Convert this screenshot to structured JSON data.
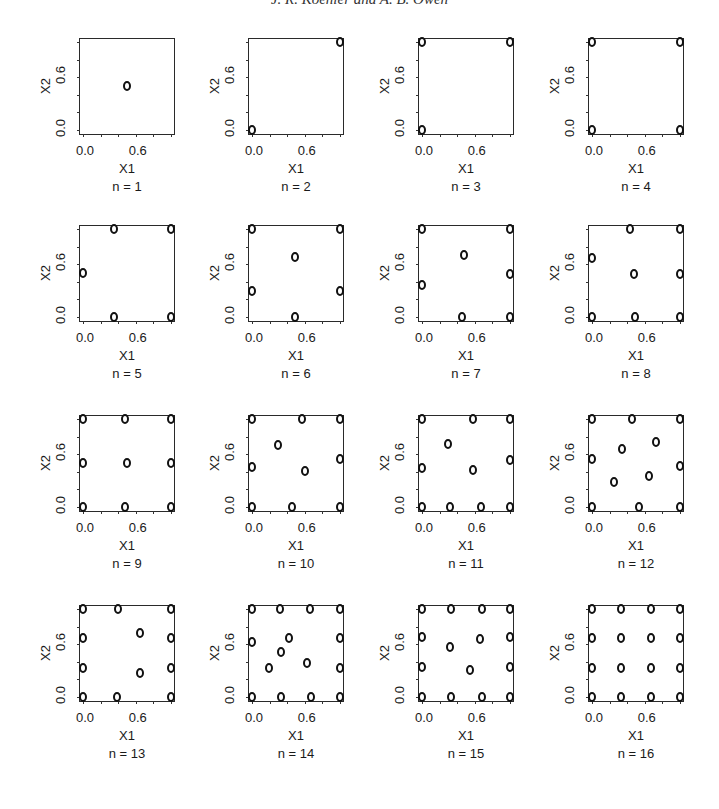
{
  "header": {
    "text": "J. R. Koehler and A. B. Owen"
  },
  "axes": {
    "xlabel": "X1",
    "ylabel": "X2",
    "xticks": [
      "0.0",
      "0.6"
    ],
    "yticks": [
      "0.0",
      "0.6"
    ]
  },
  "chart_data": {
    "type": "scatter",
    "title": "",
    "xlabel": "X1",
    "ylabel": "X2",
    "xlim": [
      0,
      1
    ],
    "ylim": [
      0,
      1
    ],
    "tick_labels": {
      "x": [
        "0.0",
        "0.6"
      ],
      "y": [
        "0.0",
        "0.6"
      ]
    },
    "grid": false,
    "legend": null,
    "layout": "4x4 small multiples",
    "marker": "open circle",
    "panels": [
      {
        "label": "n = 1",
        "points": [
          [
            0.5,
            0.5
          ]
        ]
      },
      {
        "label": "n = 2",
        "points": [
          [
            0,
            0
          ],
          [
            1,
            1
          ]
        ]
      },
      {
        "label": "n = 3",
        "points": [
          [
            0,
            0
          ],
          [
            0,
            1
          ],
          [
            1,
            1
          ]
        ]
      },
      {
        "label": "n = 4",
        "points": [
          [
            0,
            0
          ],
          [
            0,
            1
          ],
          [
            1,
            0
          ],
          [
            1,
            1
          ]
        ]
      },
      {
        "label": "n = 5",
        "points": [
          [
            0.35,
            1
          ],
          [
            1,
            1
          ],
          [
            0,
            0.5
          ],
          [
            0.35,
            0
          ],
          [
            1,
            0
          ]
        ]
      },
      {
        "label": "n = 6",
        "points": [
          [
            0,
            1
          ],
          [
            1,
            1
          ],
          [
            0.49,
            0.68
          ],
          [
            0,
            0.3
          ],
          [
            1,
            0.3
          ],
          [
            0.49,
            0
          ]
        ]
      },
      {
        "label": "n = 7",
        "points": [
          [
            0,
            1
          ],
          [
            1,
            1
          ],
          [
            0.48,
            0.71
          ],
          [
            1,
            0.49
          ],
          [
            0,
            0.36
          ],
          [
            0.45,
            0
          ],
          [
            1,
            0
          ]
        ]
      },
      {
        "label": "n = 8",
        "points": [
          [
            0.43,
            1
          ],
          [
            1,
            1
          ],
          [
            0,
            0.67
          ],
          [
            0.48,
            0.49
          ],
          [
            1,
            0.49
          ],
          [
            0,
            0
          ],
          [
            0.49,
            0
          ],
          [
            1,
            0
          ]
        ]
      },
      {
        "label": "n = 9",
        "points": [
          [
            0,
            1
          ],
          [
            0.48,
            1
          ],
          [
            1,
            1
          ],
          [
            0,
            0.5
          ],
          [
            0.5,
            0.5
          ],
          [
            1,
            0.5
          ],
          [
            0,
            0
          ],
          [
            0.48,
            0
          ],
          [
            1,
            0
          ]
        ]
      },
      {
        "label": "n = 10",
        "points": [
          [
            0,
            1
          ],
          [
            0.57,
            1
          ],
          [
            1,
            1
          ],
          [
            0.3,
            0.7
          ],
          [
            1,
            0.54
          ],
          [
            0,
            0.45
          ],
          [
            0.6,
            0.41
          ],
          [
            0,
            0
          ],
          [
            0.46,
            0
          ],
          [
            1,
            0
          ]
        ]
      },
      {
        "label": "n = 11",
        "points": [
          [
            0,
            1
          ],
          [
            0.58,
            1
          ],
          [
            1,
            1
          ],
          [
            0.29,
            0.72
          ],
          [
            1,
            0.53
          ],
          [
            0,
            0.44
          ],
          [
            0.58,
            0.42
          ],
          [
            0,
            0
          ],
          [
            0.32,
            0
          ],
          [
            0.67,
            0
          ],
          [
            1,
            0
          ]
        ]
      },
      {
        "label": "n = 12",
        "points": [
          [
            0,
            1
          ],
          [
            0.46,
            1
          ],
          [
            1,
            1
          ],
          [
            0.73,
            0.74
          ],
          [
            0.34,
            0.66
          ],
          [
            0,
            0.54
          ],
          [
            1,
            0.47
          ],
          [
            0.65,
            0.35
          ],
          [
            0.25,
            0.28
          ],
          [
            0,
            0
          ],
          [
            0.53,
            0
          ],
          [
            1,
            0
          ]
        ]
      },
      {
        "label": "n = 13",
        "points": [
          [
            0,
            1
          ],
          [
            0.4,
            1
          ],
          [
            1,
            1
          ],
          [
            0.65,
            0.73
          ],
          [
            0,
            0.67
          ],
          [
            1,
            0.67
          ],
          [
            0,
            0.33
          ],
          [
            1,
            0.33
          ],
          [
            0.65,
            0.27
          ],
          [
            0,
            0
          ],
          [
            0.39,
            0
          ],
          [
            1,
            0
          ]
        ]
      },
      {
        "label": "n = 14",
        "points": [
          [
            0,
            1
          ],
          [
            0.32,
            1
          ],
          [
            0.66,
            1
          ],
          [
            1,
            1
          ],
          [
            0.42,
            0.67
          ],
          [
            1,
            0.67
          ],
          [
            0,
            0.63
          ],
          [
            0.33,
            0.51
          ],
          [
            0.62,
            0.39
          ],
          [
            0.19,
            0.33
          ],
          [
            1,
            0.33
          ],
          [
            0,
            0
          ],
          [
            0.33,
            0
          ],
          [
            0.67,
            0
          ],
          [
            1,
            0
          ]
        ]
      },
      {
        "label": "n = 15",
        "points": [
          [
            0,
            1
          ],
          [
            0.33,
            1
          ],
          [
            0.68,
            1
          ],
          [
            1,
            1
          ],
          [
            0,
            0.68
          ],
          [
            1,
            0.68
          ],
          [
            0.66,
            0.66
          ],
          [
            0.32,
            0.57
          ],
          [
            0,
            0.34
          ],
          [
            1,
            0.34
          ],
          [
            0.55,
            0.31
          ],
          [
            0,
            0
          ],
          [
            0.33,
            0
          ],
          [
            0.68,
            0
          ],
          [
            1,
            0
          ]
        ]
      },
      {
        "label": "n = 16",
        "points": [
          [
            0,
            1
          ],
          [
            0.33,
            1
          ],
          [
            0.67,
            1
          ],
          [
            1,
            1
          ],
          [
            0,
            0.67
          ],
          [
            0.33,
            0.67
          ],
          [
            0.67,
            0.67
          ],
          [
            1,
            0.67
          ],
          [
            0,
            0.33
          ],
          [
            0.33,
            0.33
          ],
          [
            0.67,
            0.33
          ],
          [
            1,
            0.33
          ],
          [
            0,
            0
          ],
          [
            0.33,
            0
          ],
          [
            0.67,
            0
          ],
          [
            1,
            0
          ]
        ]
      }
    ]
  }
}
